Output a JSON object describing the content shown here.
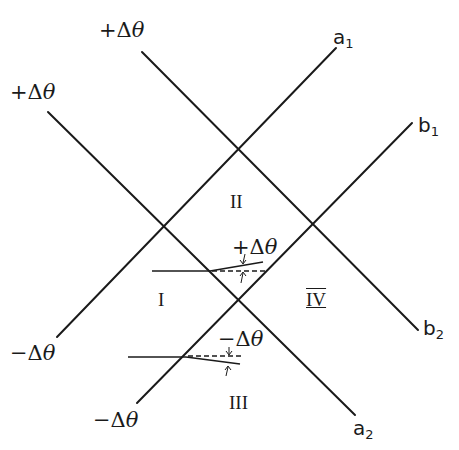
{
  "diagram": {
    "type": "characteristic-lines",
    "lines": [
      {
        "id": "line-plus-top-to-b2",
        "x1": 142,
        "y1": 52,
        "x2": 418,
        "y2": 330
      },
      {
        "id": "line-plus-left-to-a2",
        "x1": 48,
        "y1": 112,
        "x2": 355,
        "y2": 415
      },
      {
        "id": "line-minus-left-to-a1",
        "x1": 57,
        "y1": 337,
        "x2": 336,
        "y2": 48
      },
      {
        "id": "line-minus-bottom-to-b1",
        "x1": 137,
        "y1": 403,
        "x2": 412,
        "y2": 123
      }
    ],
    "line_end_labels": {
      "plus_top": {
        "sign": "+",
        "delta": "Δ",
        "theta": "θ"
      },
      "plus_left": {
        "sign": "+",
        "delta": "Δ",
        "theta": "θ"
      },
      "minus_left": {
        "sign": "−",
        "delta": "Δ",
        "theta": "θ"
      },
      "minus_bottom": {
        "sign": "−",
        "delta": "Δ",
        "theta": "θ"
      },
      "a1": {
        "letter": "a",
        "sub": "1"
      },
      "b1": {
        "letter": "b",
        "sub": "1"
      },
      "a2": {
        "letter": "a",
        "sub": "2"
      },
      "b2": {
        "letter": "b",
        "sub": "2"
      }
    },
    "regions": {
      "I": "I",
      "II": "II",
      "III": "III",
      "IV": "IV"
    },
    "deflections": {
      "upper": {
        "label": {
          "sign": "+",
          "delta": "Δ",
          "theta": "θ"
        },
        "incoming": {
          "x1": 152,
          "y1": 271,
          "x2": 210,
          "y2": 271
        },
        "deflected": {
          "x1": 210,
          "y1": 271,
          "x2": 263,
          "y2": 262
        },
        "reference": {
          "x1": 210,
          "y1": 271,
          "x2": 265,
          "y2": 271
        }
      },
      "lower": {
        "label": {
          "sign": "−",
          "delta": "Δ",
          "theta": "θ"
        },
        "incoming": {
          "x1": 128,
          "y1": 357,
          "x2": 186,
          "y2": 357
        },
        "deflected": {
          "x1": 186,
          "y1": 357,
          "x2": 240,
          "y2": 364
        },
        "reference": {
          "x1": 186,
          "y1": 357,
          "x2": 242,
          "y2": 357
        }
      }
    }
  }
}
